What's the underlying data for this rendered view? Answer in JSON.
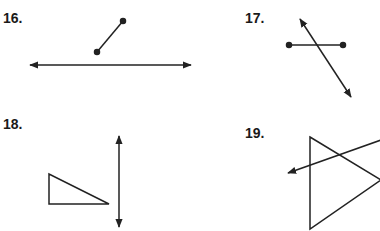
{
  "problems": [
    {
      "number": "16.",
      "figure": "segment near line"
    },
    {
      "number": "17.",
      "figure": "line intersecting segment"
    },
    {
      "number": "18.",
      "figure": "triangle beside line"
    },
    {
      "number": "19.",
      "figure": "ray crossing triangle"
    }
  ],
  "colors": {
    "stroke": "#222222",
    "background": "#ffffff"
  }
}
